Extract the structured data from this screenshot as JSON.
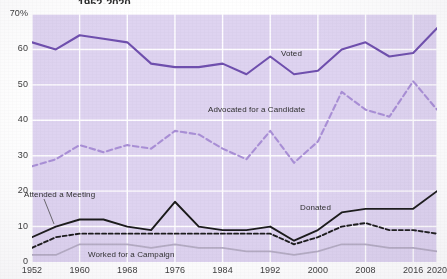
{
  "title": "1952-2020",
  "colors": {
    "plot_background": "#ded3f0",
    "gridline": "#ffffff",
    "voted": "#6f4fae",
    "advocated": "#a98fd6",
    "attended_donated": "#1a1a1a",
    "worked": "#b5acc4",
    "axis_text": "#3a3a3a",
    "page_background": "#ffffff"
  },
  "axes": {
    "y_ticks": [
      "70%",
      "60",
      "50",
      "40",
      "30",
      "20",
      "10",
      "0"
    ],
    "y_values": [
      70,
      60,
      50,
      40,
      30,
      20,
      10,
      0
    ],
    "x_ticks": [
      "1952",
      "1960",
      "1968",
      "1976",
      "1984",
      "1992",
      "2000",
      "2008",
      "2016",
      "2020"
    ],
    "x_values": [
      1952,
      1960,
      1968,
      1976,
      1984,
      1992,
      2000,
      2008,
      2016,
      2020
    ]
  },
  "series_labels": {
    "voted": "Voted",
    "advocated": "Advocated for a Candidate",
    "attended": "Attended a Meeting",
    "donated": "Donated",
    "worked": "Worked for a Campaign"
  },
  "chart_data": {
    "type": "line",
    "title": "1952-2020",
    "xlabel": "",
    "ylabel": "",
    "xlim": [
      1952,
      2020
    ],
    "ylim": [
      0,
      70
    ],
    "grid": true,
    "legend": "inline-annotations",
    "x": [
      1952,
      1956,
      1960,
      1964,
      1968,
      1972,
      1976,
      1980,
      1984,
      1988,
      1992,
      1996,
      2000,
      2004,
      2008,
      2012,
      2016,
      2020
    ],
    "series": [
      {
        "name": "Voted",
        "style": "solid",
        "color": "#6f4fae",
        "values": [
          62,
          60,
          64,
          63,
          62,
          56,
          55,
          55,
          56,
          53,
          58,
          53,
          54,
          60,
          62,
          58,
          59,
          66
        ]
      },
      {
        "name": "Advocated for a Candidate",
        "style": "dashed",
        "color": "#a98fd6",
        "values": [
          27,
          29,
          33,
          31,
          33,
          32,
          37,
          36,
          32,
          29,
          37,
          28,
          34,
          48,
          43,
          41,
          51,
          43
        ]
      },
      {
        "name": "Attended a Meeting",
        "style": "solid",
        "color": "#1a1a1a",
        "values": [
          7,
          10,
          12,
          12,
          10,
          9,
          17,
          10,
          9,
          9,
          10,
          6,
          9,
          14,
          15,
          15,
          15,
          20
        ]
      },
      {
        "name": "Donated",
        "style": "dashed",
        "color": "#1a1a1a",
        "values": [
          4,
          7,
          8,
          8,
          8,
          8,
          8,
          8,
          8,
          8,
          8,
          5,
          7,
          10,
          11,
          9,
          9,
          8
        ]
      },
      {
        "name": "Worked for a Campaign",
        "style": "solid",
        "color": "#b5acc4",
        "values": [
          2,
          2,
          5,
          5,
          5,
          4,
          5,
          4,
          4,
          3,
          3,
          2,
          3,
          5,
          5,
          4,
          4,
          3
        ]
      }
    ]
  }
}
